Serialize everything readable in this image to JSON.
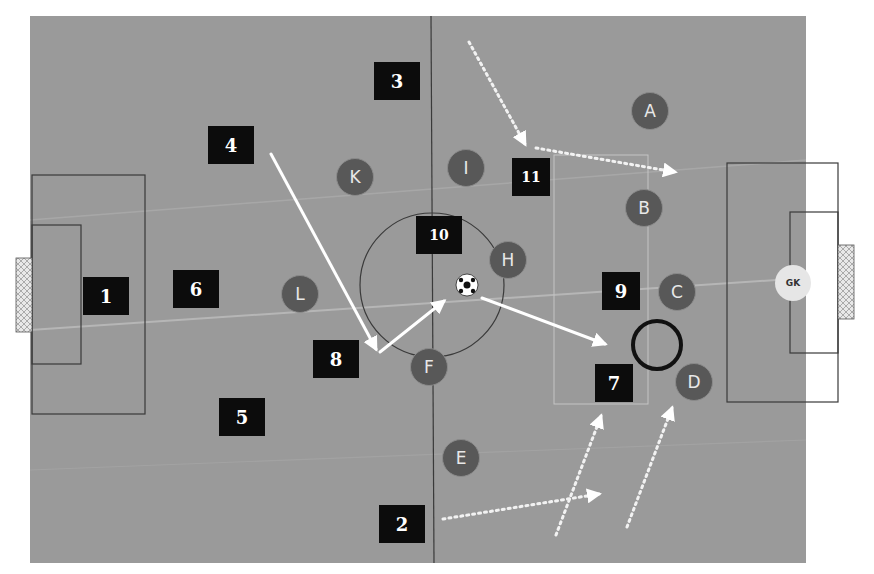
{
  "diagram": {
    "title": "",
    "colors": {
      "pitch": "#9a9a9a",
      "lines": "#3a3a3a",
      "team_marker": "#0c0c0c",
      "opponent_marker": "#585858",
      "goalkeeper_marker": "#e6e6e6",
      "pass_arrow": "#ffffff",
      "highlight_ring": "#111111"
    },
    "team_players": [
      {
        "label": "1",
        "x": 106,
        "y": 296
      },
      {
        "label": "2",
        "x": 402,
        "y": 526
      },
      {
        "label": "3",
        "x": 395,
        "y": 82
      },
      {
        "label": "4",
        "x": 229,
        "y": 149
      },
      {
        "label": "5",
        "x": 241,
        "y": 420
      },
      {
        "label": "6",
        "x": 195,
        "y": 289
      },
      {
        "label": "7",
        "x": 613,
        "y": 386
      },
      {
        "label": "8",
        "x": 334,
        "y": 359
      },
      {
        "label": "9",
        "x": 621,
        "y": 294
      },
      {
        "label": "10",
        "x": 432,
        "y": 237
      },
      {
        "label": "11",
        "x": 532,
        "y": 176
      }
    ],
    "opponents": [
      {
        "label": "A",
        "x": 650,
        "y": 111
      },
      {
        "label": "B",
        "x": 644,
        "y": 208
      },
      {
        "label": "C",
        "x": 677,
        "y": 292
      },
      {
        "label": "D",
        "x": 694,
        "y": 382
      },
      {
        "label": "E",
        "x": 461,
        "y": 458
      },
      {
        "label": "F",
        "x": 429,
        "y": 367
      },
      {
        "label": "H",
        "x": 508,
        "y": 260
      },
      {
        "label": "I",
        "x": 466,
        "y": 168
      },
      {
        "label": "K",
        "x": 355,
        "y": 177
      },
      {
        "label": "L",
        "x": 300,
        "y": 294
      }
    ],
    "goalkeeper": {
      "label": "GK",
      "x": 793,
      "y": 283
    },
    "ball": {
      "x": 467,
      "y": 285
    },
    "highlight_ring": {
      "x": 657,
      "y": 345,
      "r": 24
    },
    "passes": [
      {
        "type": "solid",
        "from": [
          271,
          154
        ],
        "to": [
          378,
          352
        ]
      },
      {
        "type": "solid",
        "from": [
          378,
          352
        ],
        "to": [
          447,
          299
        ]
      },
      {
        "type": "solid",
        "from": [
          482,
          298
        ],
        "to": [
          608,
          345
        ]
      }
    ],
    "runs": [
      {
        "type": "dotted",
        "from": [
          469,
          42
        ],
        "to": [
          527,
          147
        ]
      },
      {
        "type": "dotted",
        "from": [
          536,
          148
        ],
        "to": [
          678,
          172
        ]
      },
      {
        "type": "dotted",
        "from": [
          443,
          519
        ],
        "to": [
          602,
          494
        ]
      },
      {
        "type": "dotted",
        "from": [
          556,
          535
        ],
        "to": [
          602,
          413
        ]
      },
      {
        "type": "dotted",
        "from": [
          627,
          527
        ],
        "to": [
          673,
          405
        ]
      }
    ]
  }
}
